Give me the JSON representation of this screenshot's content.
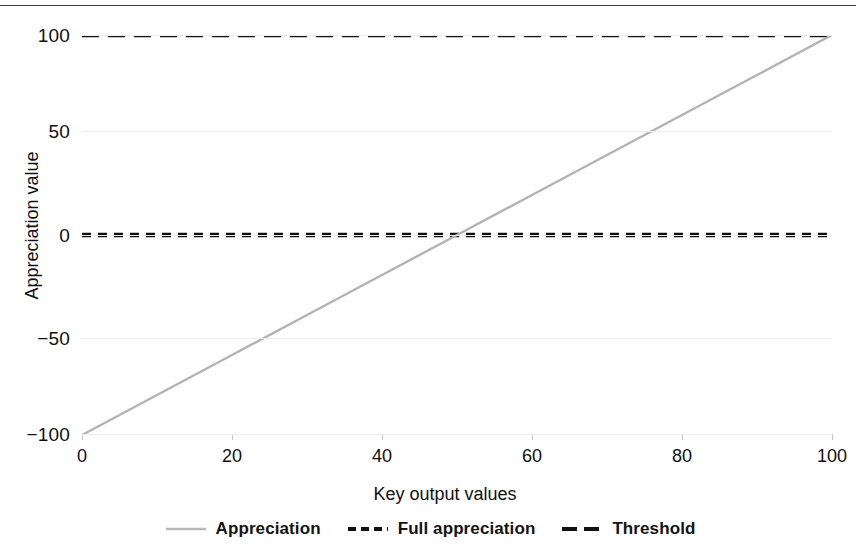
{
  "chart_data": {
    "type": "line",
    "title": "",
    "xlabel": "Key output values",
    "ylabel": "Appreciation value",
    "xlim": [
      0,
      100
    ],
    "ylim": [
      -100,
      100
    ],
    "xticks": [
      "0",
      "20",
      "40",
      "60",
      "80",
      "100"
    ],
    "yticks": [
      "100",
      "50",
      "0",
      "-50",
      "-100"
    ],
    "ytick_display": [
      "100",
      "50",
      "0",
      "−50",
      "−100"
    ],
    "grid": true,
    "legend_position": "bottom",
    "series": [
      {
        "name": "Appreciation",
        "style": "solid",
        "color": "#b3b3b3",
        "x": [
          0,
          10,
          20,
          30,
          40,
          50,
          60,
          70,
          80,
          90,
          100
        ],
        "values": [
          -100,
          -80,
          -60,
          -40,
          -20,
          0,
          20,
          40,
          60,
          80,
          100
        ]
      },
      {
        "name": "Full appreciation",
        "style": "dashed",
        "color": "#111111",
        "x": [
          0,
          100
        ],
        "values": [
          100,
          100
        ]
      },
      {
        "name": "Threshold",
        "style": "dashed",
        "color": "#111111",
        "x": [
          0,
          100
        ],
        "values": [
          0,
          0
        ]
      }
    ]
  },
  "axes": {
    "x_title": "Key output values",
    "y_title": "Appreciation value",
    "x_tick_labels": [
      "0",
      "20",
      "40",
      "60",
      "80",
      "100"
    ],
    "y_tick_labels": [
      "100",
      "50",
      "0",
      "−50",
      "−100"
    ]
  },
  "legend": {
    "items": [
      {
        "label": "Appreciation",
        "marker": "solid-line-marker",
        "color": "#b3b3b3"
      },
      {
        "label": "Full appreciation",
        "marker": "dashed-line-marker",
        "color": "#111111"
      },
      {
        "label": "Threshold",
        "marker": "long-dashed-line-marker",
        "color": "#111111"
      }
    ]
  },
  "colors": {
    "series_line": "#b3b3b3",
    "reference_line": "#111111",
    "grid": "#ededed",
    "top_rule": "#3b3b3b",
    "text": "#101010",
    "background": "#ffffff"
  }
}
